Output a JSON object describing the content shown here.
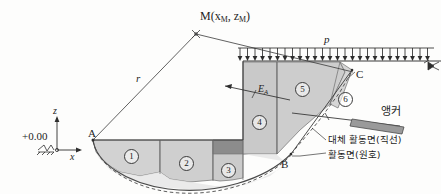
{
  "figure": {
    "domain": "geotechnical-slope-stability-diagram",
    "title_visible": false,
    "background_color": "#fdfdfc",
    "line_color": "#3a3a3a"
  },
  "points": {
    "M": {
      "label": "M(x",
      "sub1": "M",
      "mid": ", z",
      "sub2": "M",
      "close": ")",
      "x": 196,
      "y": 30
    },
    "A": {
      "label": "A",
      "x": 92,
      "y": 137
    },
    "B": {
      "label": "B",
      "x": 282,
      "y": 168
    },
    "C": {
      "label": "C",
      "x": 352,
      "y": 75
    }
  },
  "labels": {
    "radius": "r",
    "surcharge": "p",
    "earth_pressure": "E",
    "earth_pressure_sub": "A",
    "datum": "+0.00",
    "axis_z": "z",
    "axis_x": "x",
    "anchor": "앵커",
    "alt_slip_surface": "대체 활동면(직선)",
    "slip_surface": "활동면(원호)"
  },
  "slices": [
    {
      "id": "1",
      "label": "①",
      "text": "1",
      "cx": 131,
      "cy": 156
    },
    {
      "id": "2",
      "label": "②",
      "text": "2",
      "cx": 186,
      "cy": 163
    },
    {
      "id": "3",
      "label": "③",
      "text": "3",
      "cx": 228,
      "cy": 170
    },
    {
      "id": "4",
      "label": "④",
      "text": "4",
      "cx": 259,
      "cy": 122
    },
    {
      "id": "5",
      "label": "⑤",
      "text": "5",
      "cx": 302,
      "cy": 89
    },
    {
      "id": "6",
      "label": "⑥",
      "text": "6",
      "cx": 345,
      "cy": 99
    }
  ],
  "colors": {
    "fill_light": "#d2d2d2",
    "fill_mid": "#bdbdbd",
    "fill_dark": "#8c8c8c",
    "fill_pale": "#e3e3e3",
    "anchor_bar": "#9a9a9a",
    "stroke": "#3a3a3a",
    "stroke_light": "#6e6e6e"
  },
  "surcharge_load": {
    "symbol": "p",
    "arrow_count": 26,
    "direction": "downward",
    "description": "uniform distributed load on ground surface"
  },
  "geometry_notes": {
    "slip_circle": "circular arc from A through bottom to B",
    "alternative_slip": "straight-line (dashed) alternative slip surface",
    "center_of_rotation": "M",
    "radius_line": "r from M to A"
  }
}
